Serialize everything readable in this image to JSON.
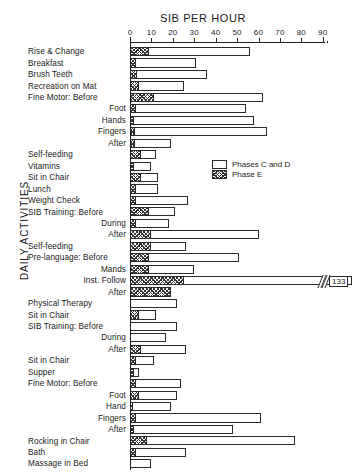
{
  "chart_data": {
    "type": "bar",
    "title": "SIB PER HOUR",
    "xlabel": "SIB PER HOUR",
    "ylabel": "DAILY ACTIVITIES",
    "orientation": "horizontal",
    "grid": false,
    "xlim": [
      0,
      90
    ],
    "xticks": [
      0,
      10,
      20,
      30,
      40,
      50,
      60,
      70,
      80,
      90
    ],
    "xticklabels": [
      "0",
      "10",
      "20",
      "30",
      "40",
      "50",
      "60",
      "70",
      "80",
      "90"
    ],
    "legend": {
      "position": "inside-upper-middle",
      "entries": [
        {
          "name": "Phases C and D",
          "fill": "white"
        },
        {
          "name": "Phase E",
          "fill": "hatched"
        }
      ]
    },
    "series": [
      {
        "name": "Phases C and D",
        "fill": "white"
      },
      {
        "name": "Phase E",
        "fill": "hatched"
      }
    ],
    "categories": [
      "Rise & Change",
      "Breakfast",
      "Brush Teeth",
      "Recreation on Mat",
      "Fine Motor: Before",
      "Foot",
      "Hands",
      "Fingers",
      "After",
      "Self-feeding",
      "Vitamins",
      "Sit in Chair",
      "Lunch",
      "Weight Check",
      "SIB Training: Before",
      "During",
      "After",
      "Self-feeding",
      "Pre-language: Before",
      "Mands",
      "Inst. Follow",
      "After",
      "Physical Therapy",
      "Sit in Chair",
      "SIB Training: Before",
      "During",
      "After",
      "Sit in Chair",
      "Supper",
      "Fine Motor: Before",
      "Foot",
      "Hand",
      "Fingers",
      "After",
      "Rocking in Chair",
      "Bath",
      "Massage in Bed"
    ],
    "rows": [
      {
        "label": "Rise & Change",
        "indent": "main",
        "cd": 56,
        "e": 9
      },
      {
        "label": "Breakfast",
        "indent": "main",
        "cd": 31,
        "e": 3
      },
      {
        "label": "Brush Teeth",
        "indent": "main",
        "cd": 36,
        "e": 3.5
      },
      {
        "label": "Recreation on Mat",
        "indent": "main",
        "cd": 25,
        "e": 4
      },
      {
        "label": "Fine Motor:  Before",
        "indent": "main",
        "cd": 62,
        "e": 11
      },
      {
        "label": "Foot",
        "indent": "sub",
        "cd": 54,
        "e": 3
      },
      {
        "label": "Hands",
        "indent": "sub",
        "cd": 58,
        "e": 2
      },
      {
        "label": "Fingers",
        "indent": "sub",
        "cd": 64,
        "e": 2.5
      },
      {
        "label": "After",
        "indent": "sub",
        "cd": 19,
        "e": 2.5
      },
      {
        "label": "Self-feeding",
        "indent": "main",
        "cd": 12,
        "e": 5
      },
      {
        "label": "Vitamins",
        "indent": "main",
        "cd": 10,
        "e": 2
      },
      {
        "label": "Sit in Chair",
        "indent": "main",
        "cd": 13,
        "e": 5
      },
      {
        "label": "Lunch",
        "indent": "main",
        "cd": 13,
        "e": 3
      },
      {
        "label": "Weight Check",
        "indent": "main",
        "cd": 27,
        "e": 3
      },
      {
        "label": "SIB Training:  Before",
        "indent": "main",
        "cd": 21,
        "e": 9
      },
      {
        "label": "During",
        "indent": "sub",
        "cd": 18,
        "e": 3
      },
      {
        "label": "After",
        "indent": "sub",
        "cd": 60,
        "e": 10
      },
      {
        "label": "Self-feeding",
        "indent": "main",
        "cd": 26,
        "e": 10
      },
      {
        "label": "Pre-language:  Before",
        "indent": "main",
        "cd": 51,
        "e": 9
      },
      {
        "label": "Mands",
        "indent": "sub",
        "cd": 30,
        "e": 9
      },
      {
        "label": "Inst. Follow",
        "indent": "sub",
        "cd": 133,
        "e": 25,
        "broken": true,
        "value_label": "133"
      },
      {
        "label": "After",
        "indent": "sub",
        "cd": 16,
        "e": 19
      },
      {
        "label": "Physical Therapy",
        "indent": "main",
        "cd": 22,
        "e": 0
      },
      {
        "label": "Sit in Chair",
        "indent": "main",
        "cd": 12,
        "e": 4
      },
      {
        "label": "SIB Training:  Before",
        "indent": "main",
        "cd": 22,
        "e": 0
      },
      {
        "label": "During",
        "indent": "sub",
        "cd": 17,
        "e": 0
      },
      {
        "label": "After",
        "indent": "sub",
        "cd": 26,
        "e": 5
      },
      {
        "label": "Sit in Chair",
        "indent": "main",
        "cd": 11,
        "e": 3
      },
      {
        "label": "Supper",
        "indent": "main",
        "cd": 4,
        "e": 2
      },
      {
        "label": "Fine Motor:  Before",
        "indent": "main",
        "cd": 24,
        "e": 3
      },
      {
        "label": "Foot",
        "indent": "sub",
        "cd": 22,
        "e": 4
      },
      {
        "label": "Hand",
        "indent": "sub",
        "cd": 19,
        "e": 1.5
      },
      {
        "label": "Fingers",
        "indent": "sub",
        "cd": 61,
        "e": 3
      },
      {
        "label": "After",
        "indent": "sub",
        "cd": 48,
        "e": 2
      },
      {
        "label": "Rocking in Chair",
        "indent": "main",
        "cd": 77,
        "e": 8
      },
      {
        "label": "Bath",
        "indent": "main",
        "cd": 26,
        "e": 3
      },
      {
        "label": "Massage in Bed",
        "indent": "main",
        "cd": 10,
        "e": 0
      }
    ]
  }
}
